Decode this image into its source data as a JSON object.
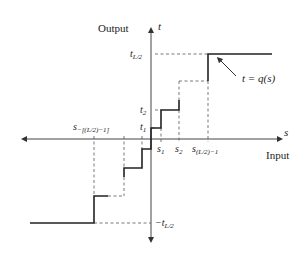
{
  "diagram": {
    "axes": {
      "vertical_label": "Output",
      "vertical_var": "t",
      "horizontal_label": "Input",
      "horizontal_var": "s"
    },
    "y_ticks": {
      "top": "t",
      "top_sub": "L/2",
      "t2": "t",
      "t2_sub": "2",
      "t1": "t",
      "t1_sub": "1",
      "bottom": "−t",
      "bottom_sub": "L/2"
    },
    "x_ticks": {
      "s1": "s",
      "s1_sub": "1",
      "s2": "s",
      "s2_sub": "2",
      "s_last": "s",
      "s_last_sub": "(L/2)−1",
      "s_neg": "s",
      "s_neg_sub": "−[(L/2)−1]"
    },
    "function_label": "t = q(s)",
    "colors": {
      "line": "#222222",
      "axis": "#444444",
      "dash": "#555555"
    }
  }
}
